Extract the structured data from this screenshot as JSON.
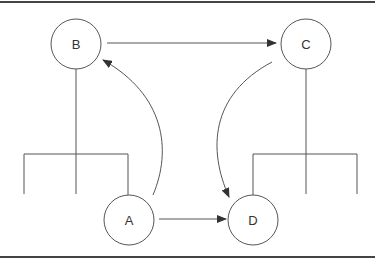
{
  "diagram": {
    "type": "node-graph",
    "colors": {
      "stroke": "#555555",
      "border": "#444444",
      "background": "#ffffff",
      "text": "#333333"
    },
    "nodes": [
      {
        "id": "A",
        "label": "A",
        "cx": 129,
        "cy": 220,
        "r": 25
      },
      {
        "id": "B",
        "label": "B",
        "cx": 76,
        "cy": 44,
        "r": 25
      },
      {
        "id": "C",
        "label": "C",
        "cx": 306,
        "cy": 44,
        "r": 25
      },
      {
        "id": "D",
        "label": "D",
        "cx": 253,
        "cy": 220,
        "r": 25
      }
    ],
    "edges": [
      {
        "from": "B",
        "to": "C",
        "shape": "straight"
      },
      {
        "from": "A",
        "to": "B",
        "shape": "curved"
      },
      {
        "from": "C",
        "to": "D",
        "shape": "curved"
      },
      {
        "from": "A",
        "to": "D",
        "shape": "straight"
      }
    ],
    "trees": [
      {
        "parent": "B",
        "branches": 3
      },
      {
        "parent": "C",
        "branches": 3
      }
    ]
  }
}
